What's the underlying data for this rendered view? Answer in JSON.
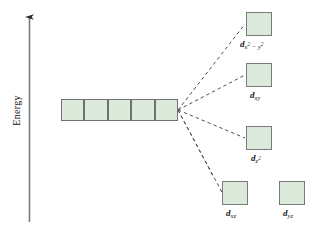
{
  "figure": {
    "axis": {
      "label": "Energy",
      "direction": "up",
      "arrow": true
    },
    "degenerate_set": {
      "name": "free-ion-d-orbitals",
      "count": 5,
      "fill_color": "#dceadb",
      "border_color": "#6f6f6f"
    },
    "split_levels": [
      {
        "id": "dx2y2",
        "label_d": "d",
        "label_sub": "x",
        "label_sup1": "2",
        "label_mid": " − ",
        "label_sub2": "y",
        "label_sup2": "2"
      },
      {
        "id": "dxy",
        "label_d": "d",
        "label_sub": "xy"
      },
      {
        "id": "dz2",
        "label_d": "d",
        "label_sub": "z",
        "label_sup1": "2"
      },
      {
        "id": "dxz",
        "label_d": "d",
        "label_sub": "xz"
      },
      {
        "id": "dyz",
        "label_d": "d",
        "label_sub": "yz"
      }
    ],
    "colors": {
      "orbital_fill": "#dceadb",
      "orbital_border": "#6f6f6f",
      "axis": "#5a5a5a",
      "dashed_line": "#4a4a4a",
      "background": "#ffffff"
    }
  }
}
